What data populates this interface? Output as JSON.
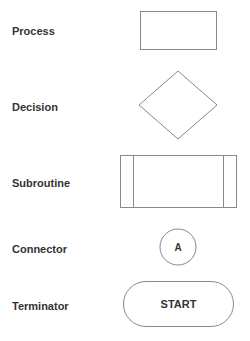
{
  "diagram": {
    "type": "flowchart-symbol-legend",
    "stroke_color": "#888888",
    "label_color": "#333333",
    "symbols": [
      {
        "label": "Process",
        "shape": "rectangle",
        "text": ""
      },
      {
        "label": "Decision",
        "shape": "diamond",
        "text": ""
      },
      {
        "label": "Subroutine",
        "shape": "predefined-process",
        "text": ""
      },
      {
        "label": "Connector",
        "shape": "circle",
        "text": "A"
      },
      {
        "label": "Terminator",
        "shape": "rounded-pill",
        "text": "START"
      }
    ]
  }
}
